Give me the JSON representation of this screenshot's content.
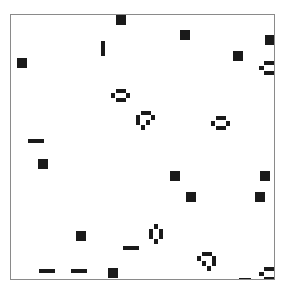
{
  "game": {
    "name": "Conway's Game of Life",
    "board": {
      "left": 10,
      "top": 14,
      "width": 265,
      "height": 266,
      "border_color": "#8a8a8a",
      "background": "#ffffff"
    },
    "cell_color": "#1a1a1a",
    "cell_size": 5,
    "patterns": [
      {
        "type": "block",
        "cells": [
          [
            115,
            14,
            10,
            10
          ]
        ]
      },
      {
        "type": "blinker",
        "cells": [
          [
            100,
            40,
            4,
            15
          ]
        ]
      },
      {
        "type": "block",
        "cells": [
          [
            16,
            57,
            10,
            10
          ]
        ]
      },
      {
        "type": "block",
        "cells": [
          [
            179,
            29,
            10,
            10
          ]
        ]
      },
      {
        "type": "block",
        "cells": [
          [
            264,
            34,
            10,
            10
          ]
        ]
      },
      {
        "type": "block",
        "cells": [
          [
            232,
            50,
            10,
            10
          ]
        ]
      },
      {
        "type": "beehive",
        "cells": [
          [
            263,
            60,
            11,
            4
          ],
          [
            258,
            65,
            5,
            4
          ],
          [
            263,
            70,
            11,
            4
          ]
        ]
      },
      {
        "type": "beehive",
        "cells": [
          [
            115,
            88,
            10,
            4
          ],
          [
            110,
            92,
            4,
            5
          ],
          [
            125,
            92,
            4,
            5
          ],
          [
            115,
            97,
            10,
            4
          ]
        ]
      },
      {
        "type": "loaf",
        "cells": [
          [
            140,
            110,
            10,
            4
          ],
          [
            135,
            114,
            4,
            5
          ],
          [
            150,
            114,
            4,
            5
          ],
          [
            135,
            119,
            4,
            5
          ],
          [
            145,
            119,
            4,
            5
          ],
          [
            140,
            124,
            4,
            5
          ]
        ]
      },
      {
        "type": "beehive",
        "cells": [
          [
            215,
            115,
            10,
            4
          ],
          [
            210,
            120,
            4,
            5
          ],
          [
            225,
            120,
            4,
            5
          ],
          [
            215,
            125,
            10,
            4
          ]
        ]
      },
      {
        "type": "blinker",
        "cells": [
          [
            27,
            138,
            16,
            4
          ]
        ]
      },
      {
        "type": "block",
        "cells": [
          [
            37,
            158,
            10,
            10
          ]
        ]
      },
      {
        "type": "block",
        "cells": [
          [
            169,
            170,
            10,
            10
          ]
        ]
      },
      {
        "type": "block",
        "cells": [
          [
            259,
            170,
            10,
            10
          ]
        ]
      },
      {
        "type": "block",
        "cells": [
          [
            185,
            191,
            10,
            10
          ]
        ]
      },
      {
        "type": "block",
        "cells": [
          [
            254,
            191,
            10,
            10
          ]
        ]
      },
      {
        "type": "beehive-vertical",
        "cells": [
          [
            153,
            223,
            4,
            5
          ],
          [
            148,
            228,
            4,
            10
          ],
          [
            158,
            228,
            4,
            10
          ],
          [
            153,
            238,
            4,
            5
          ]
        ]
      },
      {
        "type": "block",
        "cells": [
          [
            75,
            230,
            10,
            10
          ]
        ]
      },
      {
        "type": "blinker",
        "cells": [
          [
            122,
            245,
            16,
            4
          ]
        ]
      },
      {
        "type": "loaf",
        "cells": [
          [
            201,
            251,
            10,
            4
          ],
          [
            196,
            255,
            4,
            5
          ],
          [
            211,
            255,
            4,
            5
          ],
          [
            201,
            260,
            4,
            5
          ],
          [
            211,
            260,
            4,
            5
          ],
          [
            206,
            265,
            4,
            5
          ]
        ]
      },
      {
        "type": "blinker",
        "cells": [
          [
            38,
            268,
            16,
            4
          ]
        ]
      },
      {
        "type": "blinker",
        "cells": [
          [
            70,
            268,
            16,
            4
          ]
        ]
      },
      {
        "type": "block",
        "cells": [
          [
            107,
            267,
            10,
            10
          ]
        ]
      },
      {
        "type": "beehive",
        "cells": [
          [
            263,
            266,
            11,
            4
          ],
          [
            258,
            271,
            5,
            4
          ],
          [
            263,
            276,
            11,
            4
          ]
        ]
      },
      {
        "type": "blinker",
        "cells": [
          [
            238,
            277,
            12,
            3
          ]
        ]
      }
    ]
  }
}
